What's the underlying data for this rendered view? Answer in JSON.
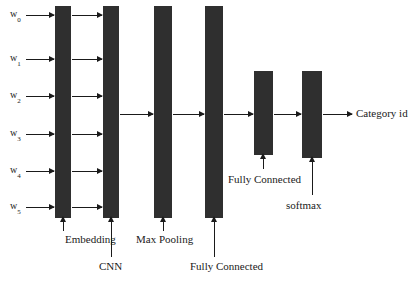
{
  "figure": {
    "kind": "neural-network-architecture-diagram",
    "background_color": "#ffffff",
    "bar_color": "#2f2f2f",
    "line_color": "#1a1a1a",
    "width": 419,
    "height": 282
  },
  "inputs": {
    "tokens": [
      {
        "base": "w",
        "sub": "0",
        "y": 15
      },
      {
        "base": "w",
        "sub": "1",
        "y": 59
      },
      {
        "base": "w",
        "sub": "2",
        "y": 96
      },
      {
        "base": "w",
        "sub": "3",
        "y": 134
      },
      {
        "base": "w",
        "sub": "4",
        "y": 171
      },
      {
        "base": "w",
        "sub": "5",
        "y": 207
      }
    ]
  },
  "layers": [
    {
      "id": "embedding",
      "caption": "Embedding",
      "x": 55,
      "y": 6,
      "w": 16,
      "h": 212
    },
    {
      "id": "cnn",
      "caption": "CNN",
      "x": 103,
      "y": 6,
      "w": 16,
      "h": 212
    },
    {
      "id": "max-pooling",
      "caption": "Max Pooling",
      "x": 154,
      "y": 6,
      "w": 18,
      "h": 212
    },
    {
      "id": "fully-connected-1",
      "caption": "Fully Connected",
      "x": 205,
      "y": 6,
      "w": 18,
      "h": 212
    },
    {
      "id": "fully-connected-2",
      "caption": "Fully Connected",
      "x": 254,
      "y": 71,
      "w": 19,
      "h": 84
    },
    {
      "id": "softmax",
      "caption": "softmax",
      "x": 302,
      "y": 71,
      "w": 20,
      "h": 87
    }
  ],
  "captions": [
    {
      "text": "Embedding",
      "x": 65,
      "y": 234
    },
    {
      "text": "CNN",
      "x": 99,
      "y": 261
    },
    {
      "text": "Max Pooling",
      "x": 136,
      "y": 234
    },
    {
      "text": "Fully Connected",
      "x": 190,
      "y": 261
    },
    {
      "text": "Fully Connected",
      "x": 228,
      "y": 174
    },
    {
      "text": "softmax",
      "x": 286,
      "y": 200
    }
  ],
  "output": {
    "label": "Category id",
    "x": 356,
    "y": 108
  }
}
